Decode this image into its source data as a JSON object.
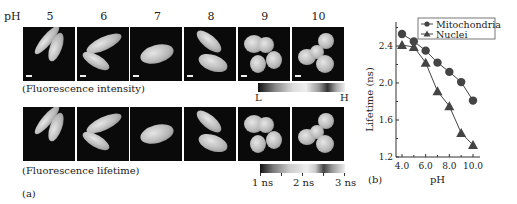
{
  "figure": {
    "panel_a_label": "(a)",
    "panel_b_label": "(b)",
    "ph_row_label": "pH",
    "ph_columns": [
      "5",
      "6",
      "7",
      "8",
      "9",
      "10"
    ],
    "row1_caption": "(Fluorescence intensity)",
    "row2_caption": "(Fluorescence lifetime)",
    "intensity_colorbar": {
      "low_label": "L",
      "high_label": "H"
    },
    "lifetime_colorbar": {
      "labels": [
        "1 ns",
        "2 ns",
        "3 ns"
      ]
    }
  },
  "chart_data": {
    "type": "line",
    "title": "",
    "xlabel": "pH",
    "ylabel": "Lifetime (ns)",
    "x": [
      4.0,
      5.0,
      6.0,
      7.0,
      8.0,
      9.0,
      10.0
    ],
    "xticks": [
      "4.0",
      "6.0",
      "8.0",
      "10.0"
    ],
    "yticks": [
      "1.2",
      "1.6",
      "2.0",
      "2.4"
    ],
    "xlim": [
      3.7,
      10.5
    ],
    "ylim": [
      1.15,
      2.62
    ],
    "grid": false,
    "legend_position": "top-right",
    "series": [
      {
        "name": "Mitochondria",
        "marker": "circle",
        "values": [
          2.53,
          2.45,
          2.35,
          2.22,
          2.12,
          2.01,
          1.81
        ]
      },
      {
        "name": "Nuclei",
        "marker": "triangle",
        "values": [
          2.41,
          2.39,
          2.22,
          1.91,
          1.75,
          1.46,
          1.33
        ]
      }
    ]
  }
}
